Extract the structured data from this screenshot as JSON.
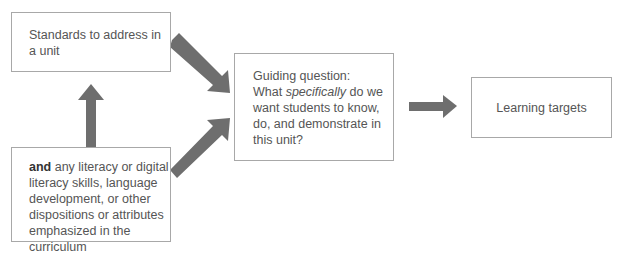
{
  "boxes": {
    "standards": {
      "text": "Standards to address in a unit"
    },
    "literacy": {
      "lead": "and",
      "text": " any literacy or digital literacy skills, language development, or other dispositions or attributes emphasized in the curriculum"
    },
    "guiding": {
      "line1": "Guiding question:",
      "pre": "What ",
      "em": "specifically",
      "post": " do we want students to know, do, and demonstrate in this unit?"
    },
    "targets": {
      "text": "Learning targets"
    }
  },
  "colors": {
    "arrow": "#6e6e6e",
    "border": "#a8a8a8"
  }
}
